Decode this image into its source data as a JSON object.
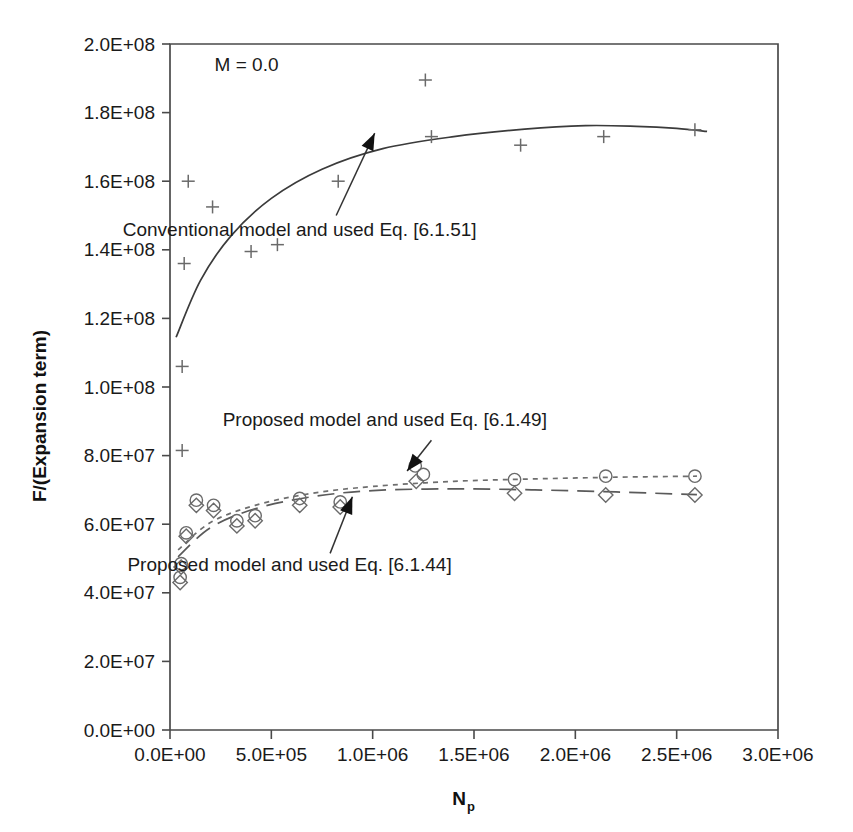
{
  "chart_data": {
    "type": "scatter",
    "title": "",
    "xlabel": "Np",
    "xlabel_base": "N",
    "xlabel_sub": "p",
    "ylabel": "F/(Expansion term)",
    "xlim": [
      0,
      3000000
    ],
    "ylim": [
      0,
      200000000
    ],
    "grid": false,
    "legend_position": "inline-annotations",
    "xticks": [
      0,
      500000,
      1000000,
      1500000,
      2000000,
      2500000,
      3000000
    ],
    "xtick_labels": [
      "0.0E+00",
      "5.0E+05",
      "1.0E+06",
      "1.5E+06",
      "2.0E+06",
      "2.5E+06",
      "3.0E+06"
    ],
    "yticks": [
      0,
      20000000,
      40000000,
      60000000,
      80000000,
      100000000,
      120000000,
      140000000,
      160000000,
      180000000,
      200000000
    ],
    "ytick_labels": [
      "0.0E+00",
      "2.0E+07",
      "4.0E+07",
      "6.0E+07",
      "8.0E+07",
      "1.0E+08",
      "1.2E+08",
      "1.4E+08",
      "1.6E+08",
      "1.8E+08",
      "2.0E+08"
    ],
    "annotations": [
      {
        "name": "condition-label",
        "text": "M = 0.0",
        "x": 220000,
        "y": 192000000
      }
    ],
    "series": [
      {
        "name": "Conventional model and used Eq. [6.1.51]",
        "marker": "plus",
        "line_style": "solid",
        "label_text": "Conventional model and used Eq. [6.1.51]",
        "label_x": 640000,
        "label_y": 144000000,
        "arrow_from": [
          820000,
          150000000
        ],
        "arrow_to": [
          1010000,
          174000000
        ],
        "points": [
          {
            "x": 60000,
            "y": 81500000
          },
          {
            "x": 60000,
            "y": 106000000
          },
          {
            "x": 70000,
            "y": 136000000
          },
          {
            "x": 90000,
            "y": 160000000
          },
          {
            "x": 210000,
            "y": 152500000
          },
          {
            "x": 400000,
            "y": 139500000
          },
          {
            "x": 530000,
            "y": 141500000
          },
          {
            "x": 830000,
            "y": 160000000
          },
          {
            "x": 1260000,
            "y": 189500000
          },
          {
            "x": 1290000,
            "y": 173000000
          },
          {
            "x": 1730000,
            "y": 170500000
          },
          {
            "x": 2140000,
            "y": 173000000
          },
          {
            "x": 2590000,
            "y": 175000000
          }
        ],
        "curve": [
          {
            "x": 30000,
            "y": 114500000
          },
          {
            "x": 150000,
            "y": 131000000
          },
          {
            "x": 300000,
            "y": 144000000
          },
          {
            "x": 500000,
            "y": 155000000
          },
          {
            "x": 750000,
            "y": 163500000
          },
          {
            "x": 1050000,
            "y": 169500000
          },
          {
            "x": 1400000,
            "y": 173000000
          },
          {
            "x": 1750000,
            "y": 175200000
          },
          {
            "x": 2050000,
            "y": 176200000
          },
          {
            "x": 2300000,
            "y": 176000000
          },
          {
            "x": 2500000,
            "y": 175400000
          },
          {
            "x": 2650000,
            "y": 174500000
          }
        ]
      },
      {
        "name": "Proposed model and used Eq. [6.1.49]",
        "marker": "circle",
        "line_style": "dotted",
        "label_text": "Proposed model and used Eq. [6.1.49]",
        "label_x": 1060000,
        "label_y": 88500000,
        "arrow_from": [
          1290000,
          84500000
        ],
        "arrow_to": [
          1170000,
          75500000
        ],
        "points": [
          {
            "x": 50000,
            "y": 44500000
          },
          {
            "x": 55000,
            "y": 48500000
          },
          {
            "x": 80000,
            "y": 57500000
          },
          {
            "x": 130000,
            "y": 67000000
          },
          {
            "x": 215000,
            "y": 65500000
          },
          {
            "x": 330000,
            "y": 61000000
          },
          {
            "x": 420000,
            "y": 62500000
          },
          {
            "x": 640000,
            "y": 67500000
          },
          {
            "x": 840000,
            "y": 66500000
          },
          {
            "x": 1210000,
            "y": 77000000
          },
          {
            "x": 1250000,
            "y": 74500000
          },
          {
            "x": 1700000,
            "y": 73000000
          },
          {
            "x": 2150000,
            "y": 74000000
          },
          {
            "x": 2590000,
            "y": 74000000
          }
        ],
        "curve": [
          {
            "x": 40000,
            "y": 52500000
          },
          {
            "x": 200000,
            "y": 60500000
          },
          {
            "x": 420000,
            "y": 65500000
          },
          {
            "x": 700000,
            "y": 69000000
          },
          {
            "x": 1000000,
            "y": 71000000
          },
          {
            "x": 1400000,
            "y": 72500000
          },
          {
            "x": 1800000,
            "y": 73200000
          },
          {
            "x": 2200000,
            "y": 73700000
          },
          {
            "x": 2600000,
            "y": 74000000
          }
        ]
      },
      {
        "name": "Proposed model and used Eq. [6.1.44]",
        "marker": "diamond",
        "line_style": "dashed",
        "label_text": "Proposed model and used Eq. [6.1.44]",
        "label_x": 590000,
        "label_y": 46500000,
        "arrow_from": [
          790000,
          51500000
        ],
        "arrow_to": [
          900000,
          68000000
        ],
        "points": [
          {
            "x": 50000,
            "y": 43000000
          },
          {
            "x": 55000,
            "y": 47500000
          },
          {
            "x": 80000,
            "y": 56500000
          },
          {
            "x": 130000,
            "y": 65500000
          },
          {
            "x": 215000,
            "y": 64000000
          },
          {
            "x": 330000,
            "y": 59500000
          },
          {
            "x": 420000,
            "y": 61000000
          },
          {
            "x": 640000,
            "y": 65500000
          },
          {
            "x": 840000,
            "y": 65000000
          },
          {
            "x": 1215000,
            "y": 72500000
          },
          {
            "x": 1700000,
            "y": 69000000
          },
          {
            "x": 2150000,
            "y": 68500000
          },
          {
            "x": 2590000,
            "y": 68500000
          }
        ],
        "curve": [
          {
            "x": 40000,
            "y": 50500000
          },
          {
            "x": 200000,
            "y": 59000000
          },
          {
            "x": 420000,
            "y": 64500000
          },
          {
            "x": 700000,
            "y": 68000000
          },
          {
            "x": 1000000,
            "y": 69800000
          },
          {
            "x": 1400000,
            "y": 70300000
          },
          {
            "x": 1800000,
            "y": 70000000
          },
          {
            "x": 2200000,
            "y": 69400000
          },
          {
            "x": 2600000,
            "y": 68600000
          }
        ]
      }
    ]
  },
  "colors": {
    "axis": "#4a4a4a",
    "text": "#1a1a1a",
    "marker": "#6a6a6a",
    "curve_solid": "#3b3b3b",
    "curve_dotted": "#6e6e6e",
    "curve_dashed": "#5a5a5a",
    "background": "#ffffff"
  }
}
